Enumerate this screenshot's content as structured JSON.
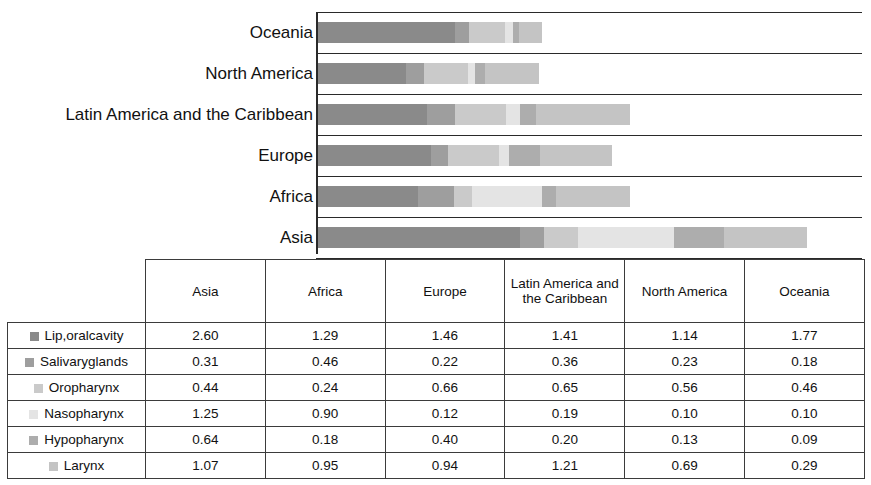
{
  "chart_data": {
    "type": "bar",
    "orientation": "horizontal",
    "stacked": true,
    "title": "",
    "xlabel": "",
    "ylabel": "",
    "grid": true,
    "legend_position": "table-row-headers",
    "axis_max": 6.4,
    "categories": [
      "Asia",
      "Africa",
      "Europe",
      "Latin America and the Caribbean",
      "North America",
      "Oceania"
    ],
    "category_order_top_to_bottom": [
      "Oceania",
      "North America",
      "Latin America and the Caribbean",
      "Europe",
      "Africa",
      "Asia"
    ],
    "series": [
      {
        "name": "Lip,oralcavity",
        "color": "#8a8a8a",
        "values": [
          2.6,
          1.29,
          1.46,
          1.41,
          1.14,
          1.77
        ]
      },
      {
        "name": "Salivaryglands",
        "color": "#9e9e9e",
        "values": [
          0.31,
          0.46,
          0.22,
          0.36,
          0.23,
          0.18
        ]
      },
      {
        "name": "Oropharynx",
        "color": "#cacaca",
        "values": [
          0.44,
          0.24,
          0.66,
          0.65,
          0.56,
          0.46
        ]
      },
      {
        "name": "Nasopharynx",
        "color": "#e4e4e4",
        "values": [
          1.25,
          0.9,
          0.12,
          0.19,
          0.1,
          0.1
        ]
      },
      {
        "name": "Hypopharynx",
        "color": "#adadad",
        "values": [
          0.64,
          0.18,
          0.4,
          0.2,
          0.13,
          0.09
        ]
      },
      {
        "name": "Larynx",
        "color": "#c4c4c4",
        "values": [
          1.07,
          0.95,
          0.94,
          1.21,
          0.69,
          0.29
        ]
      }
    ]
  },
  "table": {
    "corner_label": "",
    "column_headers": [
      "Asia",
      "Africa",
      "Europe",
      "Latin America and the Caribbean",
      "North America",
      "Oceania"
    ],
    "rows": [
      {
        "label": "Lip,oralcavity",
        "color": "#8a8a8a",
        "values": [
          "2.60",
          "1.29",
          "1.46",
          "1.41",
          "1.14",
          "1.77"
        ]
      },
      {
        "label": "Salivaryglands",
        "color": "#9e9e9e",
        "values": [
          "0.31",
          "0.46",
          "0.22",
          "0.36",
          "0.23",
          "0.18"
        ]
      },
      {
        "label": "Oropharynx",
        "color": "#cacaca",
        "values": [
          "0.44",
          "0.24",
          "0.66",
          "0.65",
          "0.56",
          "0.46"
        ]
      },
      {
        "label": "Nasopharynx",
        "color": "#e4e4e4",
        "values": [
          "1.25",
          "0.90",
          "0.12",
          "0.19",
          "0.10",
          "0.10"
        ]
      },
      {
        "label": "Hypopharynx",
        "color": "#adadad",
        "values": [
          "0.64",
          "0.18",
          "0.40",
          "0.20",
          "0.13",
          "0.09"
        ]
      },
      {
        "label": "Larynx",
        "color": "#c4c4c4",
        "values": [
          "1.07",
          "0.95",
          "0.94",
          "1.21",
          "0.69",
          "0.29"
        ]
      }
    ]
  },
  "style": {
    "axis_color": "#2a2a2a",
    "border_color": "#3b3b3b",
    "background": "#ffffff",
    "px_per_unit": 77.5
  }
}
